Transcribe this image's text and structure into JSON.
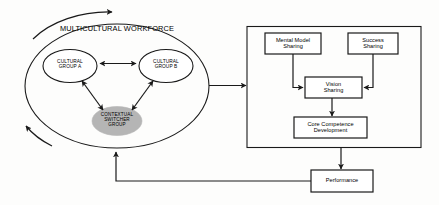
{
  "diagram": {
    "title": "MULTICULTURAL WORKFORCE",
    "left_cluster": {
      "outer_label": "MULTICULTURAL WORKFORCE",
      "group_a": "CULTURAL\nGROUP A",
      "group_b": "CULTURAL\nGROUP B",
      "switcher": "CONTEXTUAL\nSWITCHER\nGROUP"
    },
    "right_cluster": {
      "mental_model": "Mental Model\nSharing",
      "success": "Success\nSharing",
      "vision": "Vision\nSharing",
      "core_competence": "Core Competence\nDevelopment"
    },
    "performance": "Performance",
    "colors": {
      "stroke": "#1a1a1a",
      "switcher_fill": "#b5b5b5",
      "background": "#fdfdfc",
      "text": "#000000"
    }
  }
}
